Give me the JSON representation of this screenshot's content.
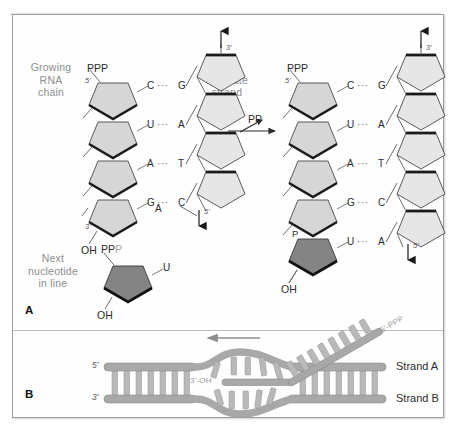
{
  "figure": {
    "panels": [
      {
        "id": "A",
        "name": "panel-a"
      },
      {
        "id": "B",
        "name": "panel-b"
      }
    ]
  },
  "panelA": {
    "labels": {
      "growing_rna_chain": "Growing\nRNA\nchain",
      "dna_template_strand": "DNA\ntemplate\nstrand",
      "next_nucleotide": "Next\nnucleotide\nin line",
      "reaction_product": "PP"
    },
    "left_structure": {
      "name": "pre-addition-complex",
      "rna_5prime_phosphates": "PPP",
      "rna_5prime_tick": "5'",
      "rna_3prime_tick": "3'",
      "rna_3prime_hydroxyl": "OH",
      "dna_top_tick": "3'",
      "dna_bottom_tick": "5'",
      "base_pairs": [
        {
          "rna": "C",
          "bond": "···",
          "dna": "G"
        },
        {
          "rna": "U",
          "bond": "···",
          "dna": "A"
        },
        {
          "rna": "A",
          "bond": "···",
          "dna": "T"
        },
        {
          "rna": "G",
          "bond": "···",
          "dna": "C"
        }
      ],
      "unpaired_template_base": "A"
    },
    "right_structure": {
      "name": "post-addition-complex",
      "rna_5prime_phosphates": "PPP",
      "rna_5prime_tick": "5'",
      "rna_3prime_hydroxyl": "OH",
      "new_nucleotide_phosphate": "P",
      "dna_top_tick": "3'",
      "dna_bottom_tick": "5'",
      "base_pairs": [
        {
          "rna": "C",
          "bond": "···",
          "dna": "G"
        },
        {
          "rna": "U",
          "bond": "···",
          "dna": "A"
        },
        {
          "rna": "A",
          "bond": "···",
          "dna": "T"
        },
        {
          "rna": "G",
          "bond": "···",
          "dna": "C"
        },
        {
          "rna": "U",
          "bond": "···",
          "dna": "A"
        }
      ]
    },
    "free_nucleotide": {
      "name": "incoming-utp",
      "phosphates_dark": "PP",
      "phosphates_light": "P",
      "base": "U",
      "hydroxyl": "OH"
    }
  },
  "panelB": {
    "labels": {
      "strand_a": "Strand A",
      "strand_b": "Strand B",
      "left_5prime": "5'",
      "left_3prime": "3'",
      "rna_3prime_oh": "3'-OH",
      "rna_5prime_ppp": "5'-PPP"
    }
  },
  "colors": {
    "sugar_fill": "#d6d6d6",
    "sugar_fill_new": "#848484",
    "sugar_edge_dark": "#1a1a1a",
    "dna_sugar_fill": "#e6e6e6",
    "label_gray": "#8d8d8d",
    "text_dark": "#2b2b2b",
    "strand_backbone": "#a8a8a8",
    "rung_fill": "#b9b9b9",
    "frame": "#9a9a9a"
  }
}
